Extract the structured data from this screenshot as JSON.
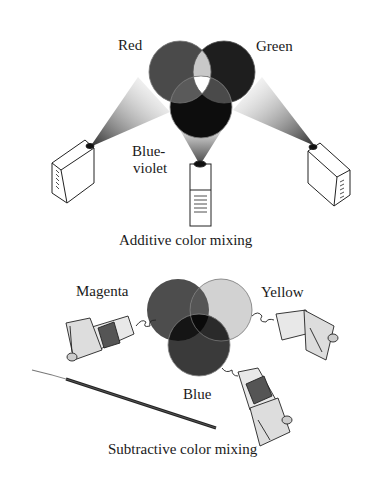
{
  "additive": {
    "caption": "Additive color mixing",
    "labels": {
      "red": "Red",
      "green": "Green",
      "blue_violet_line1": "Blue-",
      "blue_violet_line2": "violet"
    },
    "colors": {
      "red_circle": "#4a4a4a",
      "green_circle": "#1e1e1e",
      "blue_violet_circle": "#0d0d0d",
      "red_green_overlap": "#c8c8c8",
      "white_center": "#ffffff",
      "red_blue_overlap": "#5a5a5a",
      "green_blue_overlap": "#4a4a4a"
    }
  },
  "subtractive": {
    "caption": "Subtractive color mixing",
    "labels": {
      "magenta": "Magenta",
      "yellow": "Yellow",
      "blue": "Blue"
    },
    "colors": {
      "magenta_circle": "#4d4d4d",
      "yellow_circle": "#d2d2d2",
      "blue_circle": "#3a3a3a",
      "magenta_yellow_overlap": "#555555",
      "magenta_blue_overlap": "#151515",
      "yellow_blue_overlap": "#2a2a2a",
      "center_overlap": "#0a0a0a"
    }
  }
}
